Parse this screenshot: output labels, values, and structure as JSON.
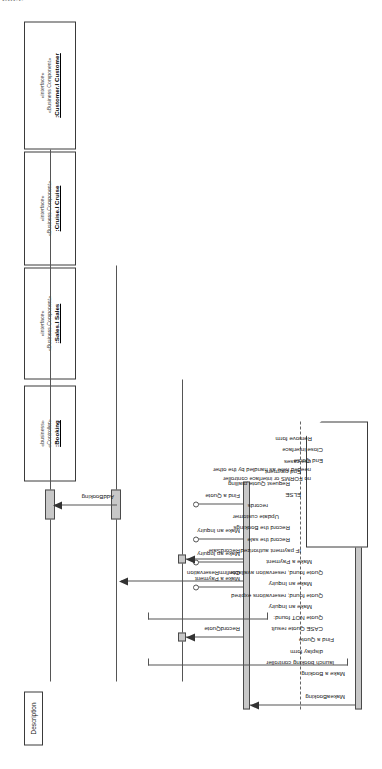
{
  "page": {
    "clipped_header_fragment": "cess",
    "diagram_type": "UML sequence diagram",
    "orientation": "rotated-90-ccw"
  },
  "lifelines": [
    {
      "id": "customer",
      "stereotype1": "«interface»",
      "stereotype2": "«Business Component»",
      "name": ":Customer.I Customer"
    },
    {
      "id": "cruise",
      "stereotype1": "«interface»",
      "stereotype2": "«Business Component»",
      "name": ":Cruise.I Cruise"
    },
    {
      "id": "sales",
      "stereotype1": "«interface»",
      "stereotype2": "«Business Component»",
      "name": ":Sales.I Sales"
    },
    {
      "id": "booking",
      "stereotype1": "«business»",
      "stereotype2": "«Controller»",
      "name": ":Booking"
    }
  ],
  "messages": [
    {
      "id": "makeabooking",
      "label": "MakeaBooking",
      "from": "actor",
      "to": "booking",
      "kind": "found-arrow"
    },
    {
      "id": "find-a-quote",
      "label": "Find a Quote",
      "from": "booking",
      "to": "boundary",
      "kind": "ball"
    },
    {
      "id": "make-an-inquiry-1",
      "label": "Make an Inquiry",
      "from": "booking",
      "to": "boundary",
      "kind": "ball"
    },
    {
      "id": "make-an-inquiry-2",
      "label": "Make an Inquiry",
      "from": "booking",
      "to": "boundary",
      "kind": "ball"
    },
    {
      "id": "make-a-payment",
      "label": "Make a Payment",
      "from": "booking",
      "to": "boundary",
      "kind": "ball"
    },
    {
      "id": "recordsale",
      "label": "RecordSale",
      "from": "booking",
      "to": "sales",
      "kind": "arrow"
    },
    {
      "id": "confirmreservation",
      "label": "ConfirmReservation",
      "from": "booking",
      "to": "cruise",
      "kind": "arrow"
    },
    {
      "id": "recordquote",
      "label": "RecordQuote",
      "from": "booking",
      "to": "sales",
      "kind": "arrow"
    },
    {
      "id": "addbooking",
      "label": "AddBooking",
      "from": "cruise",
      "to": "customer",
      "kind": "arrow"
    }
  ],
  "note": {
    "text": "no FORMS or interface controller\nneeded here as handled by the other\nuse cases"
  },
  "description": {
    "title": "Description",
    "lines": [
      {
        "text": "Make a Booking",
        "indent": 0
      },
      {
        "text": "launch booking controller",
        "indent": 1
      },
      {
        "text": "display form",
        "indent": 2
      },
      {
        "text": "Find a Quote",
        "indent": 1
      },
      {
        "text": "CASE Quote result",
        "indent": 2
      },
      {
        "text": "Quote NOT found:",
        "indent": 2
      },
      {
        "text": "Make an Inquiry",
        "indent": 3
      },
      {
        "text": "Quote found; reservations expired",
        "indent": 2
      },
      {
        "text": "Make an Inquiry",
        "indent": 3
      },
      {
        "text": "Quote found, reservation available",
        "indent": 2
      },
      {
        "text": "Make a Payment",
        "indent": 3
      },
      {
        "text": "IF payment authorized",
        "indent": 4
      },
      {
        "text": "Record the sale",
        "indent": 5
      },
      {
        "text": "Record the Bookings",
        "indent": 5
      },
      {
        "text": "Update customer",
        "indent": 6
      },
      {
        "text": "records",
        "indent": 7
      },
      {
        "text": "ELSE",
        "indent": 4
      },
      {
        "text": "Request Quote mailing",
        "indent": 5
      },
      {
        "text": "End payment",
        "indent": 4
      },
      {
        "text": "End Quote",
        "indent": 2
      },
      {
        "text": "Close interface",
        "indent": 2
      },
      {
        "text": "Remove form",
        "indent": 3
      }
    ]
  },
  "colors": {
    "line": "#555555",
    "activation_fill": "#c8c8c8",
    "border": "#3a3a3a",
    "text": "#1a1a1a",
    "background": "#ffffff"
  }
}
